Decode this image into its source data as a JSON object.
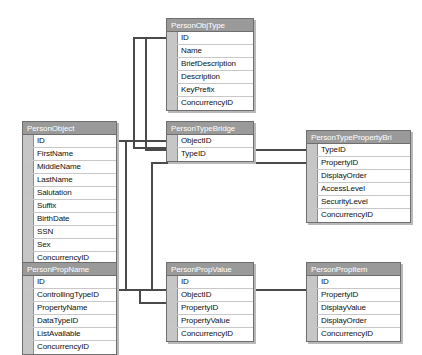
{
  "diagram": {
    "kind": "database-relationship-diagram",
    "background_color": "#ffffff",
    "header_color": "#9a9a9a",
    "header_text_color": "#ffffff",
    "gutter_color": "#c6c6c6",
    "border_color": "#6e6e6e",
    "connector_color": "#4a4a4a"
  },
  "tables": [
    {
      "id": "person-obj-type",
      "title": "PersonObjType",
      "x": 166,
      "y": 18,
      "width": 88,
      "columns": [
        "ID",
        "Name",
        "BriefDescription",
        "Description",
        "KeyPrefix",
        "ConcurrencyID"
      ]
    },
    {
      "id": "person-object",
      "title": "PersonObject",
      "x": 22,
      "y": 121,
      "width": 95,
      "columns": [
        "ID",
        "FirstName",
        "MiddleName",
        "LastName",
        "Salutation",
        "Suffix",
        "BirthDate",
        "SSN",
        "Sex",
        "ConcurrencyID"
      ]
    },
    {
      "id": "person-type-bridge",
      "title": "PersonTypeBridge",
      "x": 166,
      "y": 121,
      "width": 88,
      "columns": [
        "ObjectID",
        "TypeID"
      ]
    },
    {
      "id": "person-type-property-bridge",
      "title": "PersonTypePropertyBri",
      "x": 306,
      "y": 130,
      "width": 105,
      "columns": [
        "TypeID",
        "PropertyID",
        "DisplayOrder",
        "AccessLevel",
        "SecurityLevel",
        "ConcurrencyID"
      ]
    },
    {
      "id": "person-prop-name",
      "title": "PersonPropName",
      "x": 22,
      "y": 262,
      "width": 95,
      "columns": [
        "ID",
        "ControllingTypeID",
        "PropertyName",
        "DataTypeID",
        "ListAvailable",
        "ConcurrencyID"
      ]
    },
    {
      "id": "person-prop-value",
      "title": "PersonPropValue",
      "x": 166,
      "y": 262,
      "width": 88,
      "columns": [
        "ID",
        "ObjectID",
        "PropertyID",
        "PropertyValue",
        "ConcurrencyID"
      ]
    },
    {
      "id": "person-prop-item",
      "title": "PersonPropItem",
      "x": 306,
      "y": 262,
      "width": 95,
      "columns": [
        "ID",
        "PropertyID",
        "DisplayValue",
        "DisplayOrder",
        "ConcurrencyID"
      ]
    }
  ],
  "relationships": [
    {
      "id": "rel-objtype-typebridge",
      "from": "person-obj-type.ID",
      "to": "person-type-bridge.TypeID",
      "path": "M 166 38 L 134 38 L 134 148 L 166 148"
    },
    {
      "id": "rel-object-typebridge",
      "from": "person-object.ID",
      "to": "person-type-bridge.ObjectID",
      "path": "M 117 141 L 166 141"
    },
    {
      "id": "rel-objtype-typepropbridge",
      "from": "person-obj-type.ID",
      "to": "person-type-property-bridge.TypeID",
      "path": "M 166 38 L 146 38 L 146 150 L 306 150"
    },
    {
      "id": "rel-propname-typepropbridge",
      "from": "person-prop-name.ID",
      "to": "person-type-property-bridge.PropertyID",
      "path": "M 117 290 L 152 290 L 152 163 L 306 163"
    },
    {
      "id": "rel-object-propvalue",
      "from": "person-object.ID",
      "to": "person-prop-value.ObjectID",
      "path": "M 117 141 L 126 141 L 126 290 L 166 290"
    },
    {
      "id": "rel-propname-propvalue",
      "from": "person-prop-name.ID",
      "to": "person-prop-value.PropertyID",
      "path": "M 117 290 L 140 290 L 140 303 L 166 303"
    },
    {
      "id": "rel-propname-propitem",
      "from": "person-prop-name.ID",
      "to": "person-prop-item.PropertyID",
      "path": "M 117 290 L 296 290 L 296 290 L 306 290"
    }
  ]
}
